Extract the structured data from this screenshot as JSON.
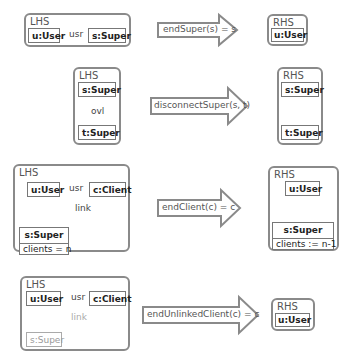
{
  "rules": [
    {
      "lhs": {
        "label": "LHS",
        "nodes": [
          {
            "name": "u:User"
          },
          {
            "name": "s:Super"
          }
        ],
        "edges": [
          {
            "label": "usr"
          }
        ]
      },
      "arrow": {
        "label": "endSuper(s) = s"
      },
      "rhs": {
        "label": "RHS",
        "nodes": [
          {
            "name": "u:User"
          }
        ]
      }
    },
    {
      "lhs": {
        "label": "LHS",
        "nodes": [
          {
            "name": "s:Super"
          },
          {
            "name": "t:Super"
          }
        ],
        "edges": [
          {
            "label": "ovl"
          }
        ]
      },
      "arrow": {
        "label": "disconnectSuper(s, t)"
      },
      "rhs": {
        "label": "RHS",
        "nodes": [
          {
            "name": "s:Super"
          },
          {
            "name": "t:Super"
          }
        ]
      }
    },
    {
      "lhs": {
        "label": "LHS",
        "nodes": [
          {
            "name": "u:User"
          },
          {
            "name": "c:Client"
          },
          {
            "name": "s:Super",
            "attr": "clients = n"
          }
        ],
        "edges": [
          {
            "label": "usr"
          },
          {
            "label": "link"
          }
        ]
      },
      "arrow": {
        "label": "endClient(c) = c"
      },
      "rhs": {
        "label": "RHS",
        "nodes": [
          {
            "name": "u:User"
          },
          {
            "name": "s:Super",
            "attr": "clients := n-1"
          }
        ]
      }
    },
    {
      "lhs": {
        "label": "LHS",
        "nodes": [
          {
            "name": "u:User"
          },
          {
            "name": "c:Client"
          },
          {
            "name": "s:Super",
            "negated": true
          }
        ],
        "edges": [
          {
            "label": "usr"
          },
          {
            "label": "link",
            "negated": true
          }
        ]
      },
      "arrow": {
        "label": "endUnlinkedClient(c) = c"
      },
      "rhs": {
        "label": "RHS",
        "nodes": [
          {
            "name": "u:User"
          }
        ]
      }
    }
  ],
  "colors": {
    "panel_border": "#8a8a8a",
    "node_border": "#777777",
    "arrow_stroke": "#8a8a8a",
    "arrow_fill": "#ffffff",
    "faded": "#999999"
  }
}
